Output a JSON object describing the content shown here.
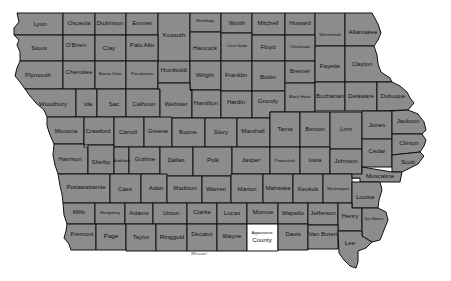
{
  "map": {
    "title": "Iowa Counties",
    "fill_color": "#8c8c8c",
    "highlight_color": "#ffffff",
    "border_color": "#111111",
    "highlighted_county": "Appanoose County",
    "neighbor_state_label": "Missouri"
  },
  "counties": [
    {
      "name": "Lyon"
    },
    {
      "name": "Osceola"
    },
    {
      "name": "Dickinson"
    },
    {
      "name": "Emmet"
    },
    {
      "name": "Kossuth"
    },
    {
      "name": "Winnebago"
    },
    {
      "name": "Worth"
    },
    {
      "name": "Mitchell"
    },
    {
      "name": "Howard"
    },
    {
      "name": "Winneshiek"
    },
    {
      "name": "Allamakee"
    },
    {
      "name": "Sioux"
    },
    {
      "name": "O'Brien"
    },
    {
      "name": "Clay"
    },
    {
      "name": "Palo Alto"
    },
    {
      "name": "Hancock"
    },
    {
      "name": "Cerro Gordo"
    },
    {
      "name": "Floyd"
    },
    {
      "name": "Chickasaw"
    },
    {
      "name": "Plymouth"
    },
    {
      "name": "Cherokee"
    },
    {
      "name": "Buena Vista"
    },
    {
      "name": "Pocahontas"
    },
    {
      "name": "Humboldt"
    },
    {
      "name": "Wright"
    },
    {
      "name": "Franklin"
    },
    {
      "name": "Butler"
    },
    {
      "name": "Bremer"
    },
    {
      "name": "Fayette"
    },
    {
      "name": "Clayton"
    },
    {
      "name": "Woodbury"
    },
    {
      "name": "Ida"
    },
    {
      "name": "Sac"
    },
    {
      "name": "Calhoun"
    },
    {
      "name": "Webster"
    },
    {
      "name": "Hamilton"
    },
    {
      "name": "Hardin"
    },
    {
      "name": "Grundy"
    },
    {
      "name": "Black Hawk"
    },
    {
      "name": "Buchanan"
    },
    {
      "name": "Delaware"
    },
    {
      "name": "Dubuque"
    },
    {
      "name": "Monona"
    },
    {
      "name": "Crawford"
    },
    {
      "name": "Carroll"
    },
    {
      "name": "Greene"
    },
    {
      "name": "Boone"
    },
    {
      "name": "Story"
    },
    {
      "name": "Marshall"
    },
    {
      "name": "Tama"
    },
    {
      "name": "Benton"
    },
    {
      "name": "Linn"
    },
    {
      "name": "Jones"
    },
    {
      "name": "Jackson"
    },
    {
      "name": "Harrison"
    },
    {
      "name": "Shelby"
    },
    {
      "name": "Audubon"
    },
    {
      "name": "Guthrie"
    },
    {
      "name": "Dallas"
    },
    {
      "name": "Polk"
    },
    {
      "name": "Jasper"
    },
    {
      "name": "Poweshiek"
    },
    {
      "name": "Iowa"
    },
    {
      "name": "Johnson"
    },
    {
      "name": "Cedar"
    },
    {
      "name": "Clinton"
    },
    {
      "name": "Scott"
    },
    {
      "name": "Pottawattamie"
    },
    {
      "name": "Cass"
    },
    {
      "name": "Adair"
    },
    {
      "name": "Madison"
    },
    {
      "name": "Warren"
    },
    {
      "name": "Marion"
    },
    {
      "name": "Mahaska"
    },
    {
      "name": "Keokuk"
    },
    {
      "name": "Washington"
    },
    {
      "name": "Muscatine"
    },
    {
      "name": "Louisa"
    },
    {
      "name": "Mills"
    },
    {
      "name": "Montgomery"
    },
    {
      "name": "Adams"
    },
    {
      "name": "Union"
    },
    {
      "name": "Clarke"
    },
    {
      "name": "Lucas"
    },
    {
      "name": "Monroe"
    },
    {
      "name": "Wapello"
    },
    {
      "name": "Jefferson"
    },
    {
      "name": "Henry"
    },
    {
      "name": "Des Moines"
    },
    {
      "name": "Fremont"
    },
    {
      "name": "Page"
    },
    {
      "name": "Taylor"
    },
    {
      "name": "Ringgold"
    },
    {
      "name": "Decatur"
    },
    {
      "name": "Wayne"
    },
    {
      "name": "Appanoose",
      "line2": "County"
    },
    {
      "name": "Davis"
    },
    {
      "name": "Van Buren"
    },
    {
      "name": "Lee"
    }
  ]
}
